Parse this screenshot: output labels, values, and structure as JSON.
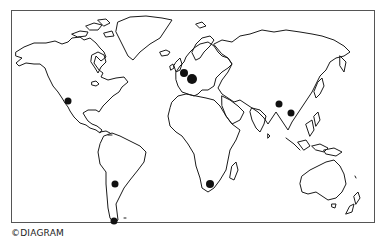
{
  "map": {
    "type": "world outline map",
    "frame_color": "#555555",
    "coast_color": "#1a1a1a",
    "marker_color": "#111111",
    "markers": [
      {
        "region": "North America (Southwest USA)",
        "x": 68,
        "y": 101,
        "r": 3.5
      },
      {
        "region": "Western Europe",
        "x": 184,
        "y": 73,
        "r": 4
      },
      {
        "region": "Central Europe",
        "x": 192,
        "y": 79,
        "r": 5
      },
      {
        "region": "Southern Asia",
        "x": 279,
        "y": 104,
        "r": 3.5
      },
      {
        "region": "Southeast Asia",
        "x": 291,
        "y": 113,
        "r": 3.5
      },
      {
        "region": "South Africa",
        "x": 210,
        "y": 184,
        "r": 4
      },
      {
        "region": "South America (Chile/Argentina)",
        "x": 115,
        "y": 184,
        "r": 3.5
      },
      {
        "region": "South America (Patagonia)",
        "x": 114,
        "y": 221,
        "r": 3.5
      }
    ]
  },
  "credit": {
    "text": "©DIAGRAM"
  }
}
